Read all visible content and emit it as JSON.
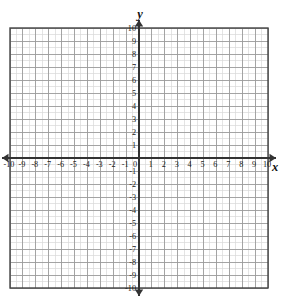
{
  "figure": {
    "kind": "cartesian-coordinate-grid",
    "background_color": "#ffffff",
    "axis_color": "#333333",
    "major_grid_color": "#9a9a9a",
    "minor_grid_color": "#d8d8d8",
    "border_color": "#444444",
    "label_color": "#1a1a1a"
  },
  "axes": {
    "x_axis_label": "x",
    "y_axis_label": "y",
    "x_min": -10,
    "x_max": 10,
    "y_min": -10,
    "y_max": 10,
    "major_step": 1,
    "minor_subdivisions": 2,
    "arrows": [
      "left",
      "right",
      "up",
      "down"
    ]
  },
  "x_tick_labels": [
    "-10",
    "-9",
    "-8",
    "-7",
    "-6",
    "-5",
    "-4",
    "-3",
    "-2",
    "-1",
    "0",
    "1",
    "2",
    "3",
    "4",
    "5",
    "6",
    "7",
    "8",
    "9",
    "10"
  ],
  "y_tick_labels": [
    "10",
    "9",
    "8",
    "7",
    "6",
    "5",
    "4",
    "3",
    "2",
    "1",
    "-1",
    "-2",
    "-3",
    "-4",
    "-5",
    "-6",
    "-7",
    "-8",
    "-9",
    "-10"
  ],
  "origin_label": "0",
  "chart_data": {
    "type": "scatter",
    "title": "",
    "xlabel": "x",
    "ylabel": "y",
    "xlim": [
      -10,
      10
    ],
    "ylim": [
      -10,
      10
    ],
    "grid": true,
    "legend": "none",
    "series": [],
    "x": [],
    "values": [],
    "note": "Empty blank coordinate plane with no plotted data points, curves or annotations."
  }
}
